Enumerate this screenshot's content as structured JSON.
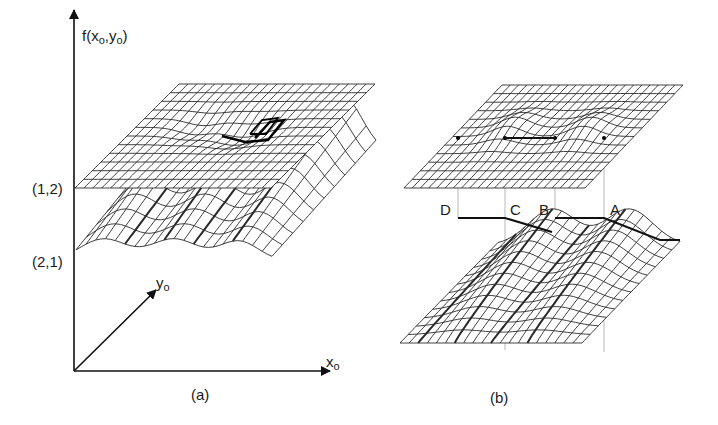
{
  "panel_a": {
    "caption": "(a)",
    "z_axis_label": {
      "fn": "f(x",
      "sub1": "o",
      "mid": ",y",
      "sub2": "o",
      "close": ")"
    },
    "x_axis_label": {
      "base": "x",
      "sub": "o"
    },
    "y_axis_label": {
      "base": "y",
      "sub": "o"
    },
    "level_labels": [
      "(1,2)",
      "(2,1)"
    ],
    "surfaces": [
      "upper-nearly-flat-sheet",
      "lower-surface-with-ridges"
    ]
  },
  "panel_b": {
    "caption": "(b)",
    "point_labels": [
      "D",
      "C",
      "B",
      "A"
    ],
    "surfaces": [
      "upper-sheet-with-marked-points",
      "lower-surface-with-peaks"
    ]
  },
  "colors": {
    "ink": "#1a1a1a",
    "grid": "#2a2a2a",
    "guide_lines": "#9a9a9a",
    "background": "#ffffff"
  }
}
